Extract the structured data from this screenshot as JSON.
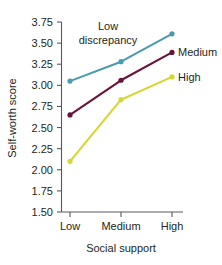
{
  "chart_data": {
    "type": "line",
    "title": "",
    "xlabel": "Social support",
    "ylabel": "Self-worth score",
    "categories": [
      "Low",
      "Medium",
      "High"
    ],
    "ylim": [
      1.5,
      3.75
    ],
    "ytick_labels": [
      "3.75",
      "3.50",
      "3.25",
      "3.00",
      "2.75",
      "2.50",
      "2.25",
      "2.00",
      "1.75",
      "1.50"
    ],
    "ytick_values": [
      3.75,
      3.5,
      3.25,
      3.0,
      2.75,
      2.5,
      2.25,
      2.0,
      1.75,
      1.5
    ],
    "grid": false,
    "legend_position": "right-inline",
    "series": [
      {
        "name": "Low discrepancy",
        "label": "Low\ndiscrepancy",
        "label_line_1": "Low",
        "label_line_2": "discrepancy",
        "color": "#4a9ab0",
        "values": [
          3.05,
          3.28,
          3.61
        ]
      },
      {
        "name": "Medium",
        "label": "Medium",
        "color": "#6b1339",
        "values": [
          2.65,
          3.06,
          3.39
        ]
      },
      {
        "name": "High",
        "label": "High",
        "color": "#d6d733",
        "values": [
          2.1,
          2.83,
          3.1
        ]
      }
    ],
    "annotations": [
      {
        "text_line_1": "Low",
        "text_line_2": "discrepancy",
        "series": "Low discrepancy"
      }
    ]
  }
}
